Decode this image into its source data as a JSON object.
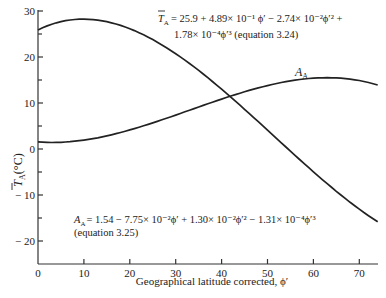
{
  "chart_data": {
    "type": "line",
    "title": "",
    "xlabel": "Geographical latitude corrected, ϕ′",
    "ylabel": "T̄A(°C)",
    "xlim": [
      0,
      74
    ],
    "ylim": [
      -25,
      30
    ],
    "grid": false,
    "x_ticks": [
      0,
      10,
      20,
      30,
      40,
      50,
      60,
      70
    ],
    "y_ticks": [
      30,
      20,
      10,
      0,
      -10,
      -20
    ],
    "y_minor_ticks": [
      25,
      15,
      5,
      -5,
      -15
    ],
    "x": [
      0,
      10,
      20,
      30,
      40,
      50,
      60,
      70,
      74
    ],
    "series": [
      {
        "name": "T̄A",
        "equation": "T̄A = 25.9 + 4.89×10⁻¹ ϕ′ − 2.74×10⁻² ϕ′² + 1.78×10⁻⁴ ϕ′³ (equation 3.24)",
        "values": [
          25.9,
          28.2,
          26.1,
          20.7,
          13.0,
          4.1,
          -5.0,
          -13.1,
          -15.8
        ]
      },
      {
        "name": "AA",
        "equation": "AA = 1.54 − 7.75×10⁻² ϕ′ + 1.30×10⁻² ϕ′² − 1.31×10⁻⁴ ϕ′³ (equation 3.25)",
        "values": [
          1.54,
          1.93,
          4.14,
          7.38,
          10.86,
          13.79,
          15.39,
          14.88,
          13.91
        ]
      }
    ],
    "annotations": [
      "T̄A = 25.9 + 4.89×10⁻¹ϕ′ − 2.74×10⁻²ϕ′² +",
      "1.78×10⁻⁴ϕ′³ (equation 3.24)",
      "AA = 1.54 − 7.75×10⁻²ϕ′ + 1.30×10⁻²ϕ′² − 1.31×10⁻⁴ϕ′³",
      "(equation 3.25)"
    ]
  },
  "labels": {
    "xlabel": "Geographical latitude corrected, ϕ′",
    "ylabel_main": "T̄",
    "ylabel_sub": "A",
    "ylabel_unit": "(°C)",
    "curve_label_main": "A",
    "curve_label_sub": "A",
    "eq1_line1": "= 25.9 + 4.89× 10⁻¹ ϕ′ − 2.74× 10⁻²ϕ′² +",
    "eq1_line2": "1.78× 10⁻⁴ϕ′³ (equation 3.24)",
    "eq2_line1": "= 1.54  − 7.75× 10⁻²ϕ′  +  1.30× 10⁻²ϕ′² − 1.31× 10⁻⁴ϕ′³",
    "eq2_line2": "(equation 3.25)"
  }
}
